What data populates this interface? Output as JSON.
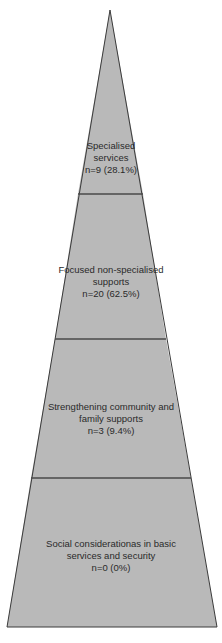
{
  "diagram": {
    "type": "pyramid",
    "colors": {
      "fill": "#b9b9b9",
      "outline": "#3a3a3a",
      "divider": "#4a4a4a",
      "text": "#2a2a2a",
      "background": "#ffffff"
    },
    "tiers": [
      {
        "level": 1,
        "position": "top",
        "title_lines": [
          "Specialised",
          "services"
        ],
        "stat": "n=9 (28.1%)",
        "n": 9,
        "percent": 28.1
      },
      {
        "level": 2,
        "position": "second",
        "title_lines": [
          "Focused non-specialised",
          "supports"
        ],
        "stat": "n=20 (62.5%)",
        "n": 20,
        "percent": 62.5
      },
      {
        "level": 3,
        "position": "third",
        "title_lines": [
          "Strengthening community and",
          "family supports"
        ],
        "stat": "n=3 (9.4%)",
        "n": 3,
        "percent": 9.4
      },
      {
        "level": 4,
        "position": "base",
        "title_lines": [
          "Social considerationas in basic",
          "services and security"
        ],
        "stat": "n=0 (0%)",
        "n": 0,
        "percent": 0
      }
    ]
  }
}
